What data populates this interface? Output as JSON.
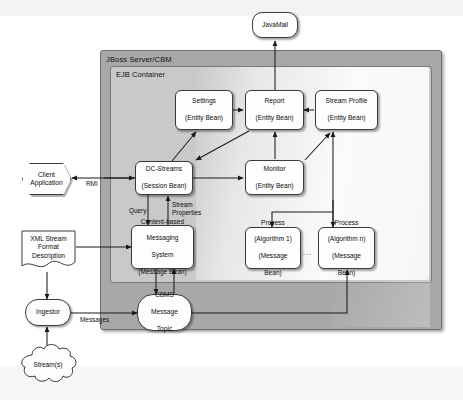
{
  "diagram": {
    "containers": [
      {
        "id": "jboss",
        "label": "JBoss Server/CBM",
        "fill": "#a8a8a8"
      },
      {
        "id": "ejb",
        "label": "EJB Container",
        "fill": "#c9c9c9"
      }
    ],
    "nodes": {
      "javamail": {
        "label": "JavaMail",
        "shape": "pill"
      },
      "settings": {
        "line1": "Settings",
        "line2": "(Entity Bean)",
        "shape": "rounded-rect"
      },
      "report": {
        "line1": "Report",
        "line2": "(Entity Bean)",
        "shape": "rounded-rect"
      },
      "stream_profile": {
        "line1": "Stream Profile",
        "line2": "(Entity Bean)",
        "shape": "rounded-rect"
      },
      "dc_streams": {
        "line1": "DC-Streams",
        "line2": "(Session Bean)",
        "shape": "rounded-rect"
      },
      "monitor": {
        "line1": "Monitor",
        "line2": "(Entity Bean)",
        "shape": "rounded-rect"
      },
      "cbms": {
        "line1": "Content-based",
        "line2": "Messaging",
        "line3": "System",
        "line4": "(Message Bean)",
        "shape": "rounded-rect"
      },
      "process_1": {
        "line1": "Process",
        "line2": "(Algorithm 1)",
        "line3": "(Message",
        "line4": "Bean)",
        "shape": "rounded-rect"
      },
      "process_n": {
        "line1": "Process",
        "line2": "(Algorithm n)",
        "line3": "(Message",
        "line4": "Bean)",
        "shape": "rounded-rect"
      },
      "process_ellipsis": {
        "label": "..."
      },
      "cbms_topic": {
        "line1": "CBMS",
        "line2": "Message",
        "line3": "Topic",
        "shape": "rounded-rect"
      },
      "client_app": {
        "line1": "Client",
        "line2": "Application",
        "shape": "hexagon"
      },
      "xml_desc": {
        "line1": "XML Stream",
        "line2": "Format",
        "line3": "Description",
        "shape": "document"
      },
      "ingestor": {
        "label": "Ingestor",
        "shape": "rounded-rect"
      },
      "streams": {
        "label": "Stream(s)",
        "shape": "cloud"
      }
    },
    "edge_labels": {
      "rmi": "RMI",
      "query": "Query",
      "stream_properties_l1": "Stream",
      "stream_properties_l2": "Properties",
      "messages": "Messages"
    },
    "colors": {
      "outer_container": "#a8a8a8",
      "inner_container": "#c9c9c9",
      "node_fill": "#fdfdfd",
      "stroke": "#3b3b3b",
      "page_background": "#ffffff"
    }
  }
}
